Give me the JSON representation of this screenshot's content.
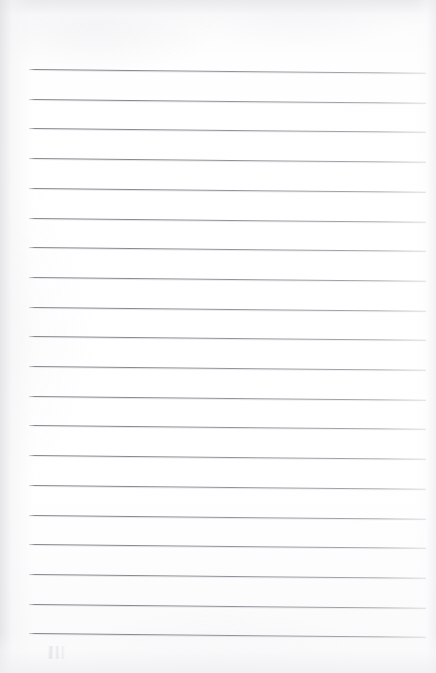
{
  "document": {
    "kind": "scanned-lined-paper",
    "title": "Blank ruled notebook page",
    "content_text": "",
    "page_width": 436,
    "page_height": 673
  },
  "paper": {
    "background_color": "#fdfdfd",
    "edge_tint_color": "#e9e9ec",
    "top_margin_px": 69,
    "bottom_margin_px": 40
  },
  "ruling": {
    "line_color": "#80808c",
    "line_count": 20,
    "first_line_y": 69,
    "line_spacing_px": 29.7,
    "line_start_x": 29,
    "line_end_x": 426,
    "skew_degrees": 0.55,
    "lines": [
      {
        "index": 1,
        "y": 69,
        "x_start": 29,
        "x_end": 426
      },
      {
        "index": 2,
        "y": 98.7,
        "x_start": 29,
        "x_end": 426
      },
      {
        "index": 3,
        "y": 128.4,
        "x_start": 29,
        "x_end": 426
      },
      {
        "index": 4,
        "y": 158.1,
        "x_start": 29,
        "x_end": 426
      },
      {
        "index": 5,
        "y": 187.8,
        "x_start": 29,
        "x_end": 426
      },
      {
        "index": 6,
        "y": 217.5,
        "x_start": 29,
        "x_end": 426
      },
      {
        "index": 7,
        "y": 247.2,
        "x_start": 29,
        "x_end": 426
      },
      {
        "index": 8,
        "y": 276.9,
        "x_start": 29,
        "x_end": 426
      },
      {
        "index": 9,
        "y": 306.6,
        "x_start": 29,
        "x_end": 426
      },
      {
        "index": 10,
        "y": 336.3,
        "x_start": 29,
        "x_end": 426
      },
      {
        "index": 11,
        "y": 366.0,
        "x_start": 29,
        "x_end": 426
      },
      {
        "index": 12,
        "y": 395.7,
        "x_start": 29,
        "x_end": 426
      },
      {
        "index": 13,
        "y": 425.4,
        "x_start": 29,
        "x_end": 426
      },
      {
        "index": 14,
        "y": 455.1,
        "x_start": 29,
        "x_end": 426
      },
      {
        "index": 15,
        "y": 484.8,
        "x_start": 29,
        "x_end": 426
      },
      {
        "index": 16,
        "y": 514.5,
        "x_start": 29,
        "x_end": 426
      },
      {
        "index": 17,
        "y": 544.2,
        "x_start": 29,
        "x_end": 426
      },
      {
        "index": 18,
        "y": 573.9,
        "x_start": 29,
        "x_end": 426
      },
      {
        "index": 19,
        "y": 603.6,
        "x_start": 29,
        "x_end": 426
      },
      {
        "index": 20,
        "y": 633.3,
        "x_start": 29,
        "x_end": 426
      }
    ]
  },
  "marks": {
    "pencil_smudge": {
      "label": "faint-pencil-smudge",
      "x": 48,
      "y": 646,
      "width": 18,
      "height": 13
    }
  }
}
